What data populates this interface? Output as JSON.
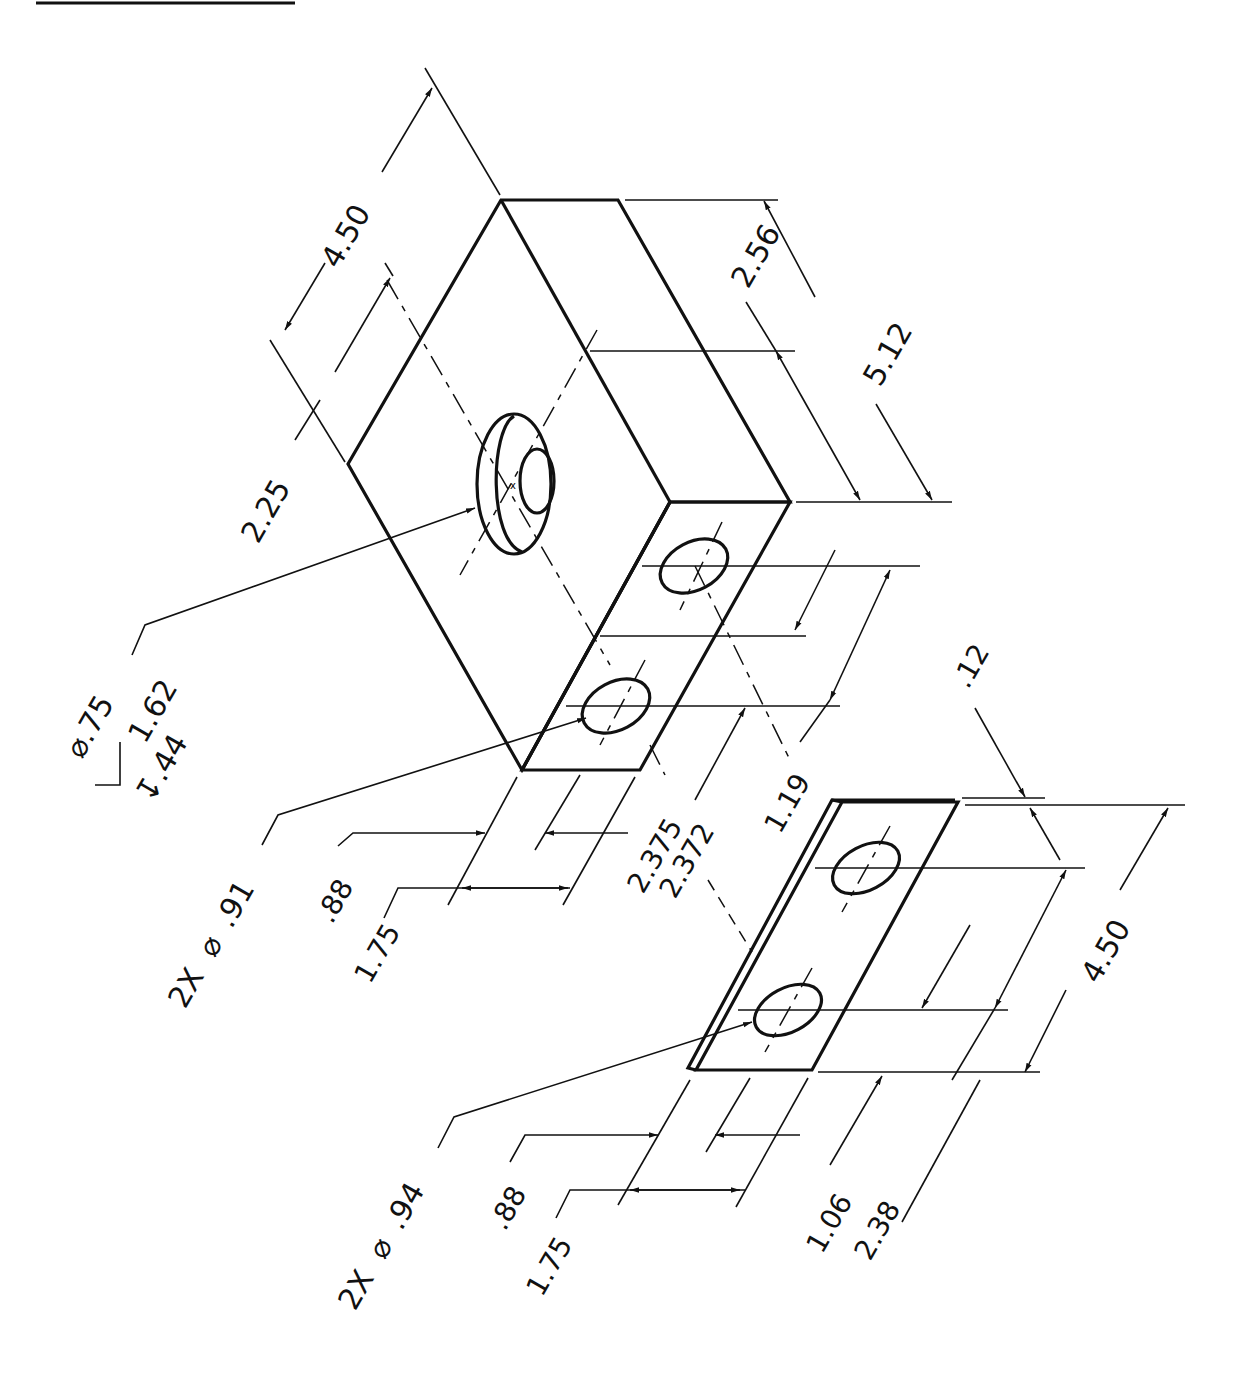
{
  "drawing": {
    "type": "isometric engineering drawing",
    "title_underline": true,
    "parts": [
      {
        "name": "block",
        "description": "rectangular block with counterbored hole on top face and two holes on front face"
      },
      {
        "name": "plate",
        "description": "thin plate with two holes"
      }
    ]
  },
  "block": {
    "dims": {
      "overall_width": "4.50",
      "hole_offset_top": "2.25",
      "half_length": "2.56",
      "overall_length": "5.12",
      "hole_spacing_a": "2.375",
      "hole_spacing_b": "2.372",
      "hole_y": "1.19",
      "hole_x_near": ".88",
      "hole_x_far": "1.75"
    },
    "counterbore": {
      "diameter": "⌀.75",
      "cbore_diameter": "1.62",
      "cbore_depth": "↧.44"
    },
    "front_holes": {
      "count": "2X",
      "diameter_symbol": "⌀",
      "diameter": ".91"
    }
  },
  "plate": {
    "dims": {
      "thickness": ".12",
      "overall_length": "4.50",
      "hole_y_near": "1.06",
      "hole_y_far": "2.38",
      "hole_x_near": ".88",
      "hole_x_far": "1.75"
    },
    "holes": {
      "count": "2X",
      "diameter_symbol": "⌀",
      "diameter": ".94"
    }
  }
}
